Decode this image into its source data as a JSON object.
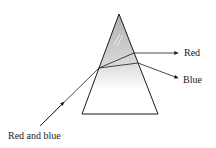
{
  "diagram": {
    "type": "prism-dispersion",
    "labels": {
      "incident": "Red and blue",
      "red": "Red",
      "blue": "Blue"
    },
    "colors": {
      "stroke": "#1a1a1a",
      "prism_fill_top": "#b8b8b8",
      "prism_fill_bottom": "#ffffff"
    }
  }
}
